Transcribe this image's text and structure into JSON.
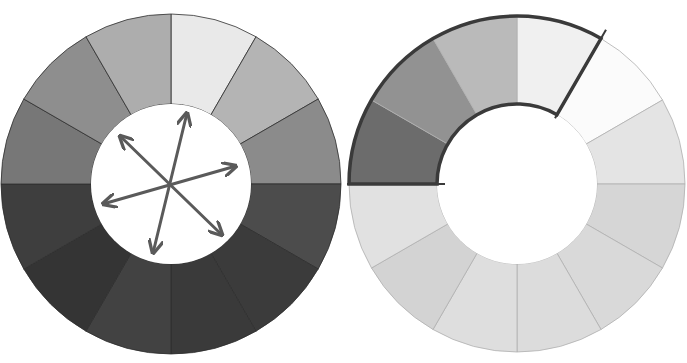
{
  "figure": {
    "width": 687,
    "height": 363
  },
  "wheels": [
    {
      "id": "value-wheel-full",
      "cx": 171,
      "cy": 184,
      "r_outer": 170,
      "r_inner": 80,
      "segment_colors": [
        "#e9e9e9",
        "#b4b4b4",
        "#8b8b8b",
        "#4c4c4c",
        "#3b3b3b",
        "#3a3a3a",
        "#424242",
        "#343434",
        "#3e3e3e",
        "#777777",
        "#8e8e8e",
        "#adadad"
      ],
      "segment_line_color": "#2e2e2e",
      "center_fill": "#ffffff",
      "arrows": {
        "color": "#5a5a5a",
        "width": 3,
        "lines": [
          {
            "x1": 187,
            "y1": 113,
            "x2": 153,
            "y2": 253
          },
          {
            "x1": 120,
            "y1": 136,
            "x2": 222,
            "y2": 235
          },
          {
            "x1": 236,
            "y1": 166,
            "x2": 103,
            "y2": 204
          }
        ]
      }
    },
    {
      "id": "value-wheel-range",
      "cx": 517,
      "cy": 184,
      "r_outer": 168,
      "r_inner": 80,
      "segment_colors": [
        "#f0f0f0",
        "#fbfbfb",
        "#e4e4e4",
        "#d6d6d6",
        "#d9d9d9",
        "#dcdcdc",
        "#dedede",
        "#d3d3d3",
        "#e1e1e1",
        "#6c6c6c",
        "#929292",
        "#bababa"
      ],
      "segment_line_color": "#b0b0b0",
      "center_fill": "#ffffff",
      "bracket": {
        "color": "#3a3a3a",
        "width": 3.5,
        "start_deg": 270,
        "end_deg": 390,
        "note": "Outline encloses segments from 9 o'clock clockwise to 1 o'clock"
      }
    }
  ]
}
